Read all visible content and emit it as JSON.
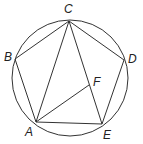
{
  "diagram": {
    "type": "geometry",
    "circle": {
      "cx": 70,
      "cy": 78,
      "r": 58
    },
    "points": {
      "A": {
        "x": 36,
        "y": 122,
        "label": "A",
        "lx": 25,
        "ly": 136
      },
      "B": {
        "x": 15,
        "y": 59,
        "label": "B",
        "lx": 4,
        "ly": 61
      },
      "C": {
        "x": 69,
        "y": 21,
        "label": "C",
        "lx": 64,
        "ly": 13
      },
      "D": {
        "x": 124,
        "y": 60,
        "label": "D",
        "lx": 128,
        "ly": 63
      },
      "E": {
        "x": 102,
        "y": 124,
        "label": "E",
        "lx": 103,
        "ly": 139
      },
      "F": {
        "x": 89,
        "y": 85,
        "label": "F",
        "lx": 93,
        "ly": 86
      }
    },
    "segments": [
      [
        "A",
        "B"
      ],
      [
        "B",
        "C"
      ],
      [
        "C",
        "D"
      ],
      [
        "D",
        "E"
      ],
      [
        "E",
        "A"
      ],
      [
        "C",
        "A"
      ],
      [
        "C",
        "E"
      ],
      [
        "A",
        "F"
      ]
    ],
    "stroke_color": "#333333"
  }
}
